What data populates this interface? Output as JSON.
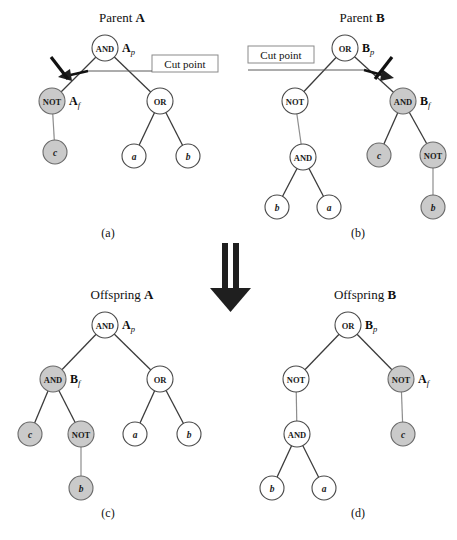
{
  "figure": {
    "type": "diagram",
    "colors": {
      "shaded_node_fill": "#cacaca",
      "plain_node_fill": "#ffffff",
      "node_stroke": "#4a4a4a",
      "edge": "#3b3b3b",
      "arrow": "#1f1f1f"
    },
    "cut_point_label": "Cut point",
    "transform_arrow": "double-down-arrow"
  },
  "panels": [
    {
      "id": "a",
      "caption": "(a)",
      "title_prefix": "Parent",
      "title_bold": "A",
      "cut_point_label": "Cut point",
      "nodes": [
        {
          "id": "a-root",
          "label": "AND",
          "kind": "op",
          "shaded": false,
          "tag": "A",
          "tag_sub": "p",
          "x": 105,
          "y": 48,
          "r": 13
        },
        {
          "id": "a-not",
          "label": "NOT",
          "kind": "op",
          "shaded": true,
          "tag": "A",
          "tag_sub": "f",
          "x": 52,
          "y": 101,
          "r": 13
        },
        {
          "id": "a-c",
          "label": "c",
          "kind": "leaf",
          "shaded": true,
          "x": 55,
          "y": 152,
          "r": 12
        },
        {
          "id": "a-or",
          "label": "OR",
          "kind": "op",
          "shaded": false,
          "x": 160,
          "y": 101,
          "r": 13
        },
        {
          "id": "a-la",
          "label": "a",
          "kind": "leaf",
          "shaded": false,
          "x": 134,
          "y": 156,
          "r": 12
        },
        {
          "id": "a-lb",
          "label": "b",
          "kind": "leaf",
          "shaded": false,
          "x": 188,
          "y": 156,
          "r": 12
        }
      ],
      "edges": [
        {
          "from": "a-root",
          "to": "a-not",
          "light": false
        },
        {
          "from": "a-root",
          "to": "a-or",
          "light": false
        },
        {
          "from": "a-not",
          "to": "a-c",
          "light": true
        },
        {
          "from": "a-or",
          "to": "a-la",
          "light": false
        },
        {
          "from": "a-or",
          "to": "a-lb",
          "light": false
        }
      ]
    },
    {
      "id": "b",
      "caption": "(b)",
      "title_prefix": "Parent",
      "title_bold": "B",
      "cut_point_label": "Cut point",
      "nodes": [
        {
          "id": "b-root",
          "label": "OR",
          "kind": "op",
          "shaded": false,
          "tag": "B",
          "tag_sub": "p",
          "x": 345,
          "y": 48,
          "r": 13
        },
        {
          "id": "b-not",
          "label": "NOT",
          "kind": "op",
          "shaded": false,
          "x": 295,
          "y": 101,
          "r": 13
        },
        {
          "id": "b-and2",
          "label": "AND",
          "kind": "op",
          "shaded": false,
          "x": 303,
          "y": 157,
          "r": 13
        },
        {
          "id": "b-lb",
          "label": "b",
          "kind": "leaf",
          "shaded": false,
          "x": 277,
          "y": 207,
          "r": 12
        },
        {
          "id": "b-la",
          "label": "a",
          "kind": "leaf",
          "shaded": false,
          "x": 329,
          "y": 207,
          "r": 12
        },
        {
          "id": "b-and",
          "label": "AND",
          "kind": "op",
          "shaded": true,
          "tag": "B",
          "tag_sub": "f",
          "x": 403,
          "y": 101,
          "r": 13
        },
        {
          "id": "b-c",
          "label": "c",
          "kind": "leaf",
          "shaded": true,
          "x": 379,
          "y": 155,
          "r": 12
        },
        {
          "id": "b-notr",
          "label": "NOT",
          "kind": "op",
          "shaded": true,
          "x": 433,
          "y": 155,
          "r": 13
        },
        {
          "id": "b-lb2",
          "label": "b",
          "kind": "leaf",
          "shaded": true,
          "x": 433,
          "y": 207,
          "r": 12
        }
      ],
      "edges": [
        {
          "from": "b-root",
          "to": "b-not",
          "light": false
        },
        {
          "from": "b-root",
          "to": "b-and",
          "light": false
        },
        {
          "from": "b-not",
          "to": "b-and2",
          "light": true
        },
        {
          "from": "b-and2",
          "to": "b-lb",
          "light": false
        },
        {
          "from": "b-and2",
          "to": "b-la",
          "light": false
        },
        {
          "from": "b-and",
          "to": "b-c",
          "light": false
        },
        {
          "from": "b-and",
          "to": "b-notr",
          "light": false
        },
        {
          "from": "b-notr",
          "to": "b-lb2",
          "light": true
        }
      ]
    },
    {
      "id": "c",
      "caption": "(c)",
      "title_prefix": "Offspring",
      "title_bold": "A",
      "nodes": [
        {
          "id": "c-root",
          "label": "AND",
          "kind": "op",
          "shaded": false,
          "tag": "A",
          "tag_sub": "p",
          "x": 105,
          "y": 325,
          "r": 13
        },
        {
          "id": "c-and",
          "label": "AND",
          "kind": "op",
          "shaded": true,
          "tag": "B",
          "tag_sub": "f",
          "x": 53,
          "y": 379,
          "r": 13
        },
        {
          "id": "c-c",
          "label": "c",
          "kind": "leaf",
          "shaded": true,
          "x": 30,
          "y": 434,
          "r": 12
        },
        {
          "id": "c-not",
          "label": "NOT",
          "kind": "op",
          "shaded": true,
          "x": 81,
          "y": 434,
          "r": 13
        },
        {
          "id": "c-b2",
          "label": "b",
          "kind": "leaf",
          "shaded": true,
          "x": 81,
          "y": 488,
          "r": 12
        },
        {
          "id": "c-or",
          "label": "OR",
          "kind": "op",
          "shaded": false,
          "x": 160,
          "y": 379,
          "r": 13
        },
        {
          "id": "c-la",
          "label": "a",
          "kind": "leaf",
          "shaded": false,
          "x": 135,
          "y": 434,
          "r": 12
        },
        {
          "id": "c-lb",
          "label": "b",
          "kind": "leaf",
          "shaded": false,
          "x": 189,
          "y": 434,
          "r": 12
        }
      ],
      "edges": [
        {
          "from": "c-root",
          "to": "c-and",
          "light": false
        },
        {
          "from": "c-root",
          "to": "c-or",
          "light": false
        },
        {
          "from": "c-and",
          "to": "c-c",
          "light": false
        },
        {
          "from": "c-and",
          "to": "c-not",
          "light": false
        },
        {
          "from": "c-not",
          "to": "c-b2",
          "light": true
        },
        {
          "from": "c-or",
          "to": "c-la",
          "light": false
        },
        {
          "from": "c-or",
          "to": "c-lb",
          "light": false
        }
      ]
    },
    {
      "id": "d",
      "caption": "(d)",
      "title_prefix": "Offspring",
      "title_bold": "B",
      "nodes": [
        {
          "id": "d-root",
          "label": "OR",
          "kind": "op",
          "shaded": false,
          "tag": "B",
          "tag_sub": "p",
          "x": 348,
          "y": 325,
          "r": 13
        },
        {
          "id": "d-not",
          "label": "NOT",
          "kind": "op",
          "shaded": false,
          "x": 296,
          "y": 379,
          "r": 13
        },
        {
          "id": "d-and",
          "label": "AND",
          "kind": "op",
          "shaded": false,
          "x": 297,
          "y": 434,
          "r": 13
        },
        {
          "id": "d-lb",
          "label": "b",
          "kind": "leaf",
          "shaded": false,
          "x": 272,
          "y": 488,
          "r": 12
        },
        {
          "id": "d-la",
          "label": "a",
          "kind": "leaf",
          "shaded": false,
          "x": 324,
          "y": 488,
          "r": 12
        },
        {
          "id": "d-notr",
          "label": "NOT",
          "kind": "op",
          "shaded": true,
          "tag": "A",
          "tag_sub": "f",
          "x": 401,
          "y": 379,
          "r": 13
        },
        {
          "id": "d-c",
          "label": "c",
          "kind": "leaf",
          "shaded": true,
          "x": 403,
          "y": 434,
          "r": 12
        }
      ],
      "edges": [
        {
          "from": "d-root",
          "to": "d-not",
          "light": false
        },
        {
          "from": "d-root",
          "to": "d-notr",
          "light": false
        },
        {
          "from": "d-not",
          "to": "d-and",
          "light": true
        },
        {
          "from": "d-and",
          "to": "d-lb",
          "light": false
        },
        {
          "from": "d-and",
          "to": "d-la",
          "light": false
        },
        {
          "from": "d-notr",
          "to": "d-c",
          "light": true
        }
      ]
    }
  ],
  "titles": {
    "a": {
      "x": 122,
      "y": 22
    },
    "b": {
      "x": 362,
      "y": 22
    },
    "c": {
      "x": 122,
      "y": 299
    },
    "d": {
      "x": 365,
      "y": 299
    }
  },
  "captions": {
    "a": {
      "x": 108,
      "y": 237
    },
    "b": {
      "x": 358,
      "y": 237
    },
    "c": {
      "x": 108,
      "y": 517
    },
    "d": {
      "x": 358,
      "y": 517
    }
  },
  "cut_boxes": {
    "a": {
      "x": 152,
      "y": 55,
      "w": 66,
      "h": 17,
      "label": "Cut point"
    },
    "b": {
      "x": 248,
      "y": 46,
      "w": 66,
      "h": 17,
      "label": "Cut point"
    }
  }
}
